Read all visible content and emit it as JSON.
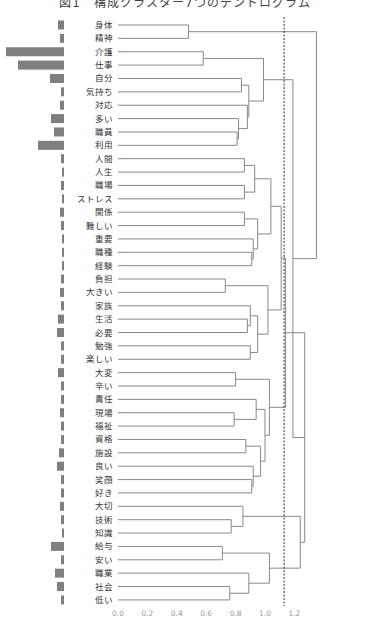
{
  "title": "図1　構成クラスター7つのデンドログラム",
  "chart_data": {
    "type": "dendrogram",
    "title": "図1　構成クラスター7つのデンドログラム",
    "xlabel": "",
    "x_ticks": [
      "0.0",
      "0.2",
      "0.4",
      "0.6",
      "0.8",
      "1.0",
      "1.2"
    ],
    "xlim": [
      0,
      1.3
    ],
    "cut_line": 1.13,
    "bar_color": "#7f7f7f",
    "line_color": "#888888",
    "leaves": [
      {
        "label": "身体",
        "freq": 6
      },
      {
        "label": "精神",
        "freq": 4
      },
      {
        "label": "介護",
        "freq": 58
      },
      {
        "label": "仕事",
        "freq": 46
      },
      {
        "label": "自分",
        "freq": 14
      },
      {
        "label": "気持ち",
        "freq": 3
      },
      {
        "label": "対応",
        "freq": 4
      },
      {
        "label": "多い",
        "freq": 13
      },
      {
        "label": "職員",
        "freq": 10
      },
      {
        "label": "利用",
        "freq": 26
      },
      {
        "label": "人間",
        "freq": 3
      },
      {
        "label": "人生",
        "freq": 2
      },
      {
        "label": "職場",
        "freq": 3
      },
      {
        "label": "ストレス",
        "freq": 2
      },
      {
        "label": "関係",
        "freq": 4
      },
      {
        "label": "難しい",
        "freq": 3
      },
      {
        "label": "重要",
        "freq": 2
      },
      {
        "label": "職種",
        "freq": 2
      },
      {
        "label": "経験",
        "freq": 2
      },
      {
        "label": "負担",
        "freq": 3
      },
      {
        "label": "大きい",
        "freq": 4
      },
      {
        "label": "家族",
        "freq": 3
      },
      {
        "label": "生活",
        "freq": 6
      },
      {
        "label": "必要",
        "freq": 7
      },
      {
        "label": "勉強",
        "freq": 3
      },
      {
        "label": "楽しい",
        "freq": 3
      },
      {
        "label": "大変",
        "freq": 6
      },
      {
        "label": "辛い",
        "freq": 3
      },
      {
        "label": "責任",
        "freq": 3
      },
      {
        "label": "現場",
        "freq": 4
      },
      {
        "label": "福祉",
        "freq": 3
      },
      {
        "label": "資格",
        "freq": 3
      },
      {
        "label": "施設",
        "freq": 5
      },
      {
        "label": "良い",
        "freq": 7
      },
      {
        "label": "笑顔",
        "freq": 3
      },
      {
        "label": "好き",
        "freq": 3
      },
      {
        "label": "大切",
        "freq": 4
      },
      {
        "label": "技術",
        "freq": 3
      },
      {
        "label": "知識",
        "freq": 2
      },
      {
        "label": "給与",
        "freq": 13
      },
      {
        "label": "安い",
        "freq": 3
      },
      {
        "label": "職業",
        "freq": 9
      },
      {
        "label": "社会",
        "freq": 7
      },
      {
        "label": "低い",
        "freq": 3
      }
    ],
    "merges": [
      {
        "id": "a1",
        "children": [
          0,
          1
        ],
        "height": 0.48
      },
      {
        "id": "a2",
        "children": [
          2,
          3
        ],
        "height": 0.58
      },
      {
        "id": "a3",
        "children": [
          4,
          5
        ],
        "height": 0.84
      },
      {
        "id": "a4",
        "children": [
          8,
          9
        ],
        "height": 0.81
      },
      {
        "id": "a5",
        "children": [
          7,
          "a4"
        ],
        "height": 0.82
      },
      {
        "id": "a6",
        "children": [
          6,
          "a5"
        ],
        "height": 0.88
      },
      {
        "id": "a7",
        "children": [
          "a3",
          "a6"
        ],
        "height": 0.89
      },
      {
        "id": "a8",
        "children": [
          "a2",
          "a7"
        ],
        "height": 0.99
      },
      {
        "id": "b1",
        "children": [
          10,
          11
        ],
        "height": 0.86
      },
      {
        "id": "b2",
        "children": [
          12,
          13
        ],
        "height": 0.86
      },
      {
        "id": "b3",
        "children": [
          "b1",
          "b2"
        ],
        "height": 0.93
      },
      {
        "id": "b4",
        "children": [
          14,
          15
        ],
        "height": 0.86
      },
      {
        "id": "b5",
        "children": [
          17,
          18
        ],
        "height": 0.91
      },
      {
        "id": "b6",
        "children": [
          16,
          "b5"
        ],
        "height": 0.92
      },
      {
        "id": "b7",
        "children": [
          "b4",
          "b6"
        ],
        "height": 0.95
      },
      {
        "id": "b8",
        "children": [
          "b3",
          "b7"
        ],
        "height": 1.04
      },
      {
        "id": "c1",
        "children": [
          19,
          20
        ],
        "height": 0.73
      },
      {
        "id": "c2",
        "children": [
          22,
          23
        ],
        "height": 0.88
      },
      {
        "id": "c3",
        "children": [
          21,
          "c2"
        ],
        "height": 0.9
      },
      {
        "id": "c4",
        "children": [
          24,
          25
        ],
        "height": 0.9
      },
      {
        "id": "c5",
        "children": [
          "c3",
          "c4"
        ],
        "height": 0.95
      },
      {
        "id": "c6",
        "children": [
          "c1",
          "c5"
        ],
        "height": 1.02
      },
      {
        "id": "c7",
        "children": [
          "b8",
          "c6"
        ],
        "height": 1.11
      },
      {
        "id": "d1",
        "children": [
          26,
          27
        ],
        "height": 0.8
      },
      {
        "id": "d2",
        "children": [
          29,
          30
        ],
        "height": 0.79
      },
      {
        "id": "d3",
        "children": [
          28,
          "d2"
        ],
        "height": 0.94
      },
      {
        "id": "d4",
        "children": [
          31,
          32
        ],
        "height": 0.87
      },
      {
        "id": "d5",
        "children": [
          34,
          35
        ],
        "height": 0.91
      },
      {
        "id": "d6",
        "children": [
          33,
          "d5"
        ],
        "height": 0.92
      },
      {
        "id": "d7",
        "children": [
          "d4",
          "d6"
        ],
        "height": 0.97
      },
      {
        "id": "d8",
        "children": [
          "d3",
          "d7"
        ],
        "height": 1.0
      },
      {
        "id": "d9",
        "children": [
          "d1",
          "d8"
        ],
        "height": 1.03
      },
      {
        "id": "d10",
        "children": [
          "c7",
          "d9"
        ],
        "height": 1.14
      },
      {
        "id": "e1",
        "children": [
          37,
          38
        ],
        "height": 0.77
      },
      {
        "id": "e2",
        "children": [
          36,
          "e1"
        ],
        "height": 0.85
      },
      {
        "id": "e3",
        "children": [
          39,
          40
        ],
        "height": 0.71
      },
      {
        "id": "e4",
        "children": [
          42,
          43
        ],
        "height": 0.76
      },
      {
        "id": "e5",
        "children": [
          41,
          "e4"
        ],
        "height": 0.89
      },
      {
        "id": "e6",
        "children": [
          "e3",
          "e5"
        ],
        "height": 1.03
      },
      {
        "id": "e7",
        "children": [
          "e2",
          "e6"
        ],
        "height": 1.24
      },
      {
        "id": "f1",
        "children": [
          "d10",
          "e7"
        ],
        "height": 1.27
      },
      {
        "id": "g1",
        "children": [
          "a8",
          "f1"
        ],
        "height": 1.19
      },
      {
        "id": "root",
        "children": [
          "a1",
          "g1"
        ],
        "height": 1.35
      }
    ]
  }
}
